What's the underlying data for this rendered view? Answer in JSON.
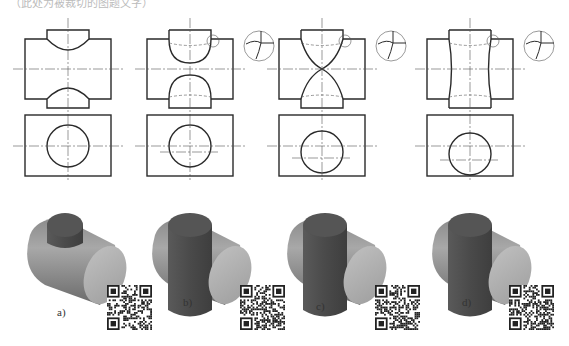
{
  "caption_top": "（此处为被裁切的图题文字）",
  "colors": {
    "line": "#2a2a2a",
    "thin_line": "#555555",
    "solid_light": "#9a9a9a",
    "solid_mid": "#7a7a7a",
    "solid_dark": "#4d4d4d",
    "solid_face": "#b5b5b5"
  },
  "panels": [
    {
      "id": "a",
      "label": "a)",
      "cx": 68,
      "has_detail": false,
      "profile": "arc"
    },
    {
      "id": "b",
      "label": "b)",
      "cx": 190,
      "has_detail": true,
      "profile": "deep-arc"
    },
    {
      "id": "c",
      "label": "c)",
      "cx": 322,
      "has_detail": true,
      "profile": "hourglass"
    },
    {
      "id": "d",
      "label": "d)",
      "cx": 470,
      "has_detail": true,
      "profile": "straight"
    }
  ],
  "qr_codes": [
    {
      "name": "qr-code-a",
      "x": 107,
      "y": 285
    },
    {
      "name": "qr-code-b",
      "x": 240,
      "y": 285
    },
    {
      "name": "qr-code-c",
      "x": 375,
      "y": 285
    },
    {
      "name": "qr-code-d",
      "x": 509,
      "y": 285
    }
  ]
}
